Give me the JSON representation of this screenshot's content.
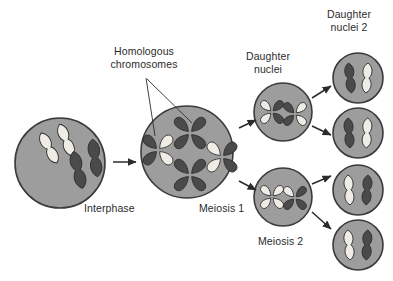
{
  "diagram": {
    "background_color": "#ffffff",
    "colors": {
      "cell_fill": "#9d9d9d",
      "cell_stroke": "#3a3a3a",
      "chromosome_dark": "#4a4a4a",
      "chromosome_light": "#eeece4",
      "chromosome_stroke": "#2e2e2e",
      "text": "#2b2b2b",
      "arrow": "#2b2b2b",
      "leader_line": "#2b2b2b"
    },
    "labels": [
      {
        "id": "homologous-chromosomes",
        "text": "Homologous\nchromosomes",
        "x": 88,
        "y": 45,
        "width": 112,
        "align": "center"
      },
      {
        "id": "daughter-nuclei",
        "text": "Daughter\nnuclei",
        "x": 233,
        "y": 50,
        "width": 70,
        "align": "center"
      },
      {
        "id": "daughter-nuclei-2",
        "text": "Daughter\nnuclei 2",
        "x": 313,
        "y": 8,
        "width": 72,
        "align": "center"
      },
      {
        "id": "interphase",
        "text": "Interphase",
        "x": 84,
        "y": 202,
        "width": 62,
        "align": "left"
      },
      {
        "id": "meiosis-1",
        "text": "Meiosis 1",
        "x": 199,
        "y": 202,
        "width": 56,
        "align": "left"
      },
      {
        "id": "meiosis-2",
        "text": "Meiosis 2",
        "x": 258,
        "y": 235,
        "width": 56,
        "align": "left"
      }
    ],
    "cells": [
      {
        "id": "interphase-cell",
        "name": "cell-interphase",
        "cx": 60,
        "cy": 163,
        "r": 45,
        "stage": "Interphase",
        "chromosome_count": 4,
        "chromosomes": [
          {
            "type": "rod",
            "shade": "light",
            "cx": 49,
            "cy": 148,
            "len": 34,
            "w": 9,
            "rot": -28
          },
          {
            "type": "rod",
            "shade": "light",
            "cx": 66,
            "cy": 140,
            "len": 34,
            "w": 9,
            "rot": -22
          },
          {
            "type": "rod",
            "shade": "dark",
            "cx": 78,
            "cy": 170,
            "len": 38,
            "w": 10,
            "rot": -14
          },
          {
            "type": "rod",
            "shade": "dark",
            "cx": 95,
            "cy": 158,
            "len": 38,
            "w": 10,
            "rot": -8
          }
        ]
      },
      {
        "id": "meiosis1-cell",
        "name": "cell-meiosis-1",
        "cx": 187,
        "cy": 152,
        "r": 46,
        "stage": "Meiosis 1",
        "chromosome_count": 4,
        "chromosomes": [
          {
            "type": "tetrad",
            "cx": 158,
            "cy": 150,
            "arm_len": 17,
            "arm_w": 9,
            "rot": 0,
            "arm_shades": [
              "dark",
              "light",
              "light",
              "dark"
            ]
          },
          {
            "type": "tetrad",
            "cx": 190,
            "cy": 133,
            "arm_len": 18,
            "arm_w": 9,
            "rot": 0,
            "arm_shades": [
              "dark",
              "dark",
              "dark",
              "dark"
            ]
          },
          {
            "type": "tetrad",
            "cx": 190,
            "cy": 175,
            "arm_len": 18,
            "arm_w": 9,
            "rot": 0,
            "arm_shades": [
              "dark",
              "dark",
              "dark",
              "dark"
            ]
          },
          {
            "type": "tetrad",
            "cx": 222,
            "cy": 157,
            "arm_len": 17,
            "arm_w": 9,
            "rot": 0,
            "arm_shades": [
              "light",
              "dark",
              "dark",
              "light"
            ]
          }
        ]
      },
      {
        "id": "daughter-nucleus-top",
        "name": "cell-daughter-nucleus-top",
        "cx": 283,
        "cy": 112,
        "r": 29,
        "stage": "Daughter nuclei",
        "chromosome_count": 2,
        "chromosomes": [
          {
            "type": "tetrad",
            "cx": 272,
            "cy": 112,
            "arm_len": 13,
            "arm_w": 7,
            "rot": 0,
            "arm_shades": [
              "light",
              "dark",
              "dark",
              "light"
            ]
          },
          {
            "type": "tetrad",
            "cx": 295,
            "cy": 114,
            "arm_len": 13,
            "arm_w": 7,
            "rot": 0,
            "arm_shades": [
              "dark",
              "light",
              "light",
              "dark"
            ]
          }
        ]
      },
      {
        "id": "daughter-nucleus-bottom",
        "name": "cell-daughter-nucleus-bottom",
        "cx": 283,
        "cy": 197,
        "r": 29,
        "stage": "Daughter nuclei",
        "chromosome_count": 2,
        "chromosomes": [
          {
            "type": "tetrad",
            "cx": 272,
            "cy": 197,
            "arm_len": 13,
            "arm_w": 7,
            "rot": 0,
            "arm_shades": [
              "light",
              "light",
              "light",
              "light"
            ]
          },
          {
            "type": "tetrad",
            "cx": 295,
            "cy": 198,
            "arm_len": 13,
            "arm_w": 7,
            "rot": 0,
            "arm_shades": [
              "light",
              "dark",
              "dark",
              "dark"
            ]
          }
        ]
      },
      {
        "id": "daughter2-nucleus-1",
        "name": "cell-daughter-nuclei-2-a",
        "cx": 358,
        "cy": 78,
        "r": 25,
        "stage": "Daughter nuclei 2",
        "chromosome_count": 2,
        "chromosomes": [
          {
            "type": "rod",
            "shade": "dark",
            "cx": 350,
            "cy": 78,
            "len": 30,
            "w": 8,
            "rot": -6
          },
          {
            "type": "rod",
            "shade": "light",
            "cx": 367,
            "cy": 78,
            "len": 30,
            "w": 8,
            "rot": 4
          }
        ]
      },
      {
        "id": "daughter2-nucleus-2",
        "name": "cell-daughter-nuclei-2-b",
        "cx": 358,
        "cy": 133,
        "r": 25,
        "stage": "Daughter nuclei 2",
        "chromosome_count": 2,
        "chromosomes": [
          {
            "type": "rod",
            "shade": "dark",
            "cx": 349,
            "cy": 133,
            "len": 30,
            "w": 8,
            "rot": -4
          },
          {
            "type": "rod",
            "shade": "light",
            "cx": 367,
            "cy": 133,
            "len": 30,
            "w": 8,
            "rot": 3
          }
        ]
      },
      {
        "id": "daughter2-nucleus-3",
        "name": "cell-daughter-nuclei-2-c",
        "cx": 358,
        "cy": 190,
        "r": 25,
        "stage": "Daughter nuclei 2",
        "chromosome_count": 2,
        "chromosomes": [
          {
            "type": "rod",
            "shade": "light",
            "cx": 349,
            "cy": 190,
            "len": 30,
            "w": 8,
            "rot": -4
          },
          {
            "type": "rod",
            "shade": "dark",
            "cx": 367,
            "cy": 190,
            "len": 30,
            "w": 8,
            "rot": 4
          }
        ]
      },
      {
        "id": "daughter2-nucleus-4",
        "name": "cell-daughter-nuclei-2-d",
        "cx": 358,
        "cy": 245,
        "r": 25,
        "stage": "Daughter nuclei 2",
        "chromosome_count": 2,
        "chromosomes": [
          {
            "type": "rod",
            "shade": "light",
            "cx": 349,
            "cy": 245,
            "len": 30,
            "w": 8,
            "rot": -5
          },
          {
            "type": "rod",
            "shade": "dark",
            "cx": 367,
            "cy": 245,
            "len": 30,
            "w": 8,
            "rot": 3
          }
        ]
      }
    ],
    "arrows": [
      {
        "id": "arrow-interphase-to-meiosis1",
        "x1": 113,
        "y1": 162,
        "x2": 136,
        "y2": 162
      },
      {
        "id": "arrow-meiosis1-to-daughter-top",
        "x1": 239,
        "y1": 128,
        "x2": 256,
        "y2": 120
      },
      {
        "id": "arrow-meiosis1-to-daughter-bottom",
        "x1": 239,
        "y1": 181,
        "x2": 256,
        "y2": 190
      },
      {
        "id": "arrow-daughter-top-to-d2a",
        "x1": 312,
        "y1": 98,
        "x2": 331,
        "y2": 86
      },
      {
        "id": "arrow-daughter-top-to-d2b",
        "x1": 312,
        "y1": 126,
        "x2": 331,
        "y2": 135
      },
      {
        "id": "arrow-daughter-bottom-to-d2c",
        "x1": 312,
        "y1": 184,
        "x2": 331,
        "y2": 176
      },
      {
        "id": "arrow-daughter-bottom-to-d2d",
        "x1": 312,
        "y1": 212,
        "x2": 331,
        "y2": 229
      }
    ],
    "leader_lines": [
      {
        "id": "leader-line-left",
        "x1": 146,
        "y1": 78,
        "x2": 155,
        "y2": 136
      },
      {
        "id": "leader-line-right",
        "x1": 147,
        "y1": 79,
        "x2": 192,
        "y2": 123
      }
    ]
  }
}
